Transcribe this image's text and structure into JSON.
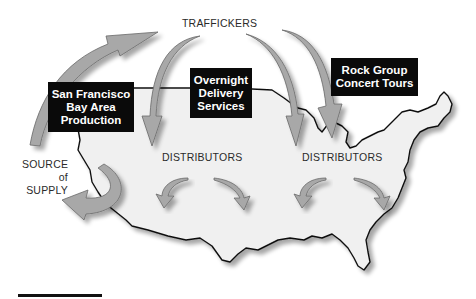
{
  "diagram": {
    "title_label": "TRAFFICKERS",
    "source_label": {
      "line1": "SOURCE",
      "line2": "of",
      "line3": "SUPPLY"
    },
    "distributors_west": "DISTRIBUTORS",
    "distributors_east": "DISTRIBUTORS",
    "boxes": [
      {
        "id": "sf",
        "lines": [
          "San Francisco",
          "Bay Area",
          "Production"
        ]
      },
      {
        "id": "overnight",
        "lines": [
          "Overnight",
          "Delivery",
          "Services"
        ]
      },
      {
        "id": "rock",
        "lines": [
          "Rock Group",
          "Concert Tours"
        ]
      }
    ],
    "colors": {
      "arrow_fill": "#a8a8a8",
      "arrow_stroke": "#6a6a6a",
      "map_fill": "#f0f0f0",
      "map_outline": "#111111",
      "box_bg": "#0a0a0a",
      "box_text": "#ffffff"
    }
  }
}
